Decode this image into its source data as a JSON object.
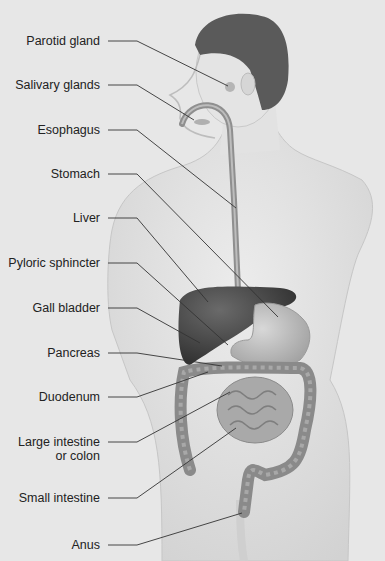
{
  "diagram": {
    "labels": [
      {
        "id": "parotid-gland",
        "text": "Parotid gland",
        "y": 41,
        "end": [
          228,
          86
        ]
      },
      {
        "id": "salivary-glands",
        "text": "Salivary glands",
        "y": 85,
        "end": [
          194,
          120
        ]
      },
      {
        "id": "esophagus",
        "text": "Esophagus",
        "y": 130,
        "end": [
          236,
          208
        ]
      },
      {
        "id": "stomach",
        "text": "Stomach",
        "y": 174,
        "end": [
          278,
          317
        ]
      },
      {
        "id": "liver",
        "text": "Liver",
        "y": 218,
        "end": [
          208,
          302
        ]
      },
      {
        "id": "pyloric-sphincter",
        "text": "Pyloric sphincter",
        "y": 263,
        "end": [
          228,
          345
        ]
      },
      {
        "id": "gall-bladder",
        "text": "Gall bladder",
        "y": 308,
        "end": [
          200,
          343
        ]
      },
      {
        "id": "pancreas",
        "text": "Pancreas",
        "y": 353,
        "end": [
          222,
          366
        ]
      },
      {
        "id": "duodenum",
        "text": "Duodenum",
        "y": 397,
        "end": [
          208,
          372
        ]
      },
      {
        "id": "large-intestine",
        "text": "Large intestine",
        "text2": "or colon",
        "y": 442,
        "end": [
          230,
          392
        ]
      },
      {
        "id": "small-intestine",
        "text": "Small intestine",
        "y": 498,
        "end": [
          236,
          428
        ]
      },
      {
        "id": "anus",
        "text": "Anus",
        "y": 545,
        "end": [
          242,
          513
        ]
      }
    ],
    "colors": {
      "background": "#e7e7e7",
      "body": "#d9d9d9",
      "hair": "#5a5a5a",
      "liver": "#4a4a4a",
      "organ": "#b8b8b8",
      "colon": "#8e8e8e",
      "leader": "#333333",
      "text": "#222222"
    }
  }
}
